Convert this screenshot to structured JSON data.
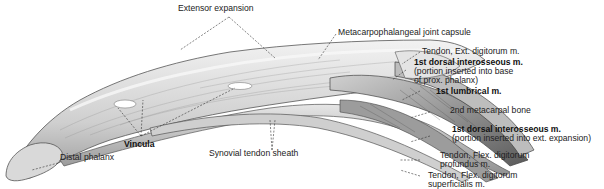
{
  "figure": {
    "colors": {
      "background": "#ffffff",
      "ink": "#222222",
      "shade_dark": "#6e6e6e",
      "shade_mid": "#b8b8b8",
      "shade_light": "#dcdcdc"
    }
  },
  "labels": {
    "extensor_expansion": "Extensor expansion",
    "mcp_capsule": "Metacarpophalangeal joint capsule",
    "tendon_ext": "Tendon, Ext. digitorum m.",
    "dorsal_inteross_1_title": "1st dorsal interosseous m.",
    "dorsal_inteross_1_line1": "(portion inserted into base",
    "dorsal_inteross_1_line2": "of prox. phalanx)",
    "lumbrical": "1st lumbrical m.",
    "metacarpal": "2nd metacarpal bone",
    "dorsal_inteross_2_title": "1st dorsal interosseous m.",
    "dorsal_inteross_2_sub": "(portion inserted into ext. expansion)",
    "flex_prof_line1": "Tendon, Flex. digitorum",
    "flex_prof_line2": "profundus m.",
    "flex_sup_line1": "Tendon, Flex. digitorum",
    "flex_sup_line2": "superficialis m.",
    "vincula": "Vincula",
    "synovial": "Synovial tendon sheath",
    "distal_phalanx": "Distal phalanx"
  }
}
